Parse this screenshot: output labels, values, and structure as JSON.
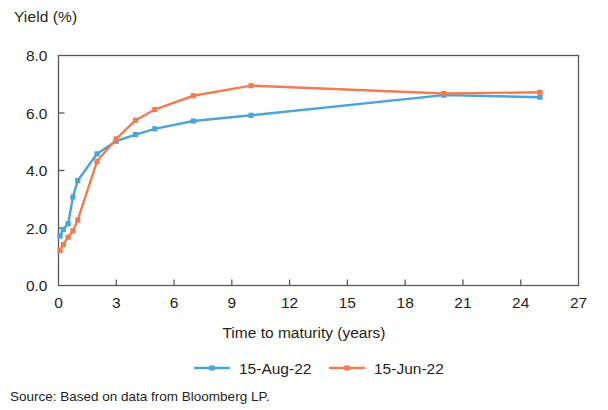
{
  "chart_data": {
    "type": "line",
    "title": "",
    "ylabel": "Yield (%)",
    "xlabel": "Time to maturity (years)",
    "xlim": [
      0,
      27
    ],
    "ylim": [
      0,
      8
    ],
    "xticks": [
      0,
      3,
      6,
      9,
      12,
      15,
      18,
      21,
      24,
      27
    ],
    "xtick_labels": [
      "0",
      "3",
      "6",
      "9",
      "12",
      "15",
      "18",
      "21",
      "24",
      "27"
    ],
    "yticks": [
      0,
      2,
      4,
      6,
      8
    ],
    "ytick_labels": [
      "0.0",
      "2.0",
      "4.0",
      "6.0",
      "8.0"
    ],
    "grid": false,
    "legend_position": "bottom",
    "marker": "square",
    "series": [
      {
        "name": "15-Aug-22",
        "color": "#4aa3da",
        "points": [
          [
            0.08,
            1.72
          ],
          [
            0.25,
            1.95
          ],
          [
            0.5,
            2.15
          ],
          [
            0.75,
            3.08
          ],
          [
            1.0,
            3.65
          ],
          [
            2.0,
            4.58
          ],
          [
            3.0,
            5.02
          ],
          [
            4.0,
            5.25
          ],
          [
            5.0,
            5.45
          ],
          [
            7.0,
            5.72
          ],
          [
            10.0,
            5.92
          ],
          [
            20.0,
            6.62
          ],
          [
            25.0,
            6.55
          ]
        ]
      },
      {
        "name": "15-Jun-22",
        "color": "#ef7d52",
        "points": [
          [
            0.08,
            1.22
          ],
          [
            0.25,
            1.42
          ],
          [
            0.5,
            1.68
          ],
          [
            0.75,
            1.9
          ],
          [
            1.0,
            2.28
          ],
          [
            2.0,
            4.32
          ],
          [
            3.0,
            5.1
          ],
          [
            4.0,
            5.75
          ],
          [
            5.0,
            6.12
          ],
          [
            7.0,
            6.6
          ],
          [
            10.0,
            6.95
          ],
          [
            20.0,
            6.68
          ],
          [
            25.0,
            6.72
          ]
        ]
      }
    ]
  },
  "legend": {
    "items": [
      {
        "label": "15-Aug-22",
        "color": "#4aa3da"
      },
      {
        "label": "15-Jun-22",
        "color": "#ef7d52"
      }
    ]
  },
  "source": {
    "text": "Source: Based on data from Bloomberg LP."
  },
  "colors": {
    "axis": "#58585a",
    "text": "#231f20",
    "series_blue": "#4aa3da",
    "series_orange": "#ef7d52",
    "background": "#ffffff"
  }
}
